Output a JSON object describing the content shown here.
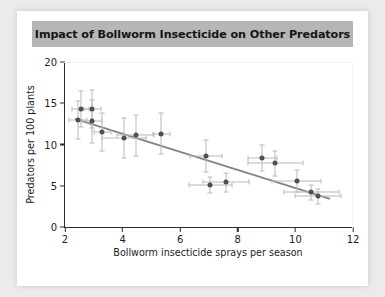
{
  "figure": {
    "title": "Impact of Bollworm Insecticide on Other Predators",
    "title_bar_color": "#b6b6b6",
    "background": "#ffffff",
    "page_background": "#eceaea"
  },
  "chart_data": {
    "type": "scatter",
    "title": "Impact of Bollworm Insecticide on Other Predators",
    "xlabel": "Bollworm insecticide sprays per season",
    "ylabel": "Predators per 100 plants",
    "xlim": [
      2,
      12
    ],
    "ylim": [
      0,
      20
    ],
    "xticks": [
      2,
      4,
      6,
      8,
      10,
      12
    ],
    "yticks": [
      0,
      5,
      10,
      15,
      20
    ],
    "grid": false,
    "legend": null,
    "marker_color": "#4b4f5c",
    "errorbar_color": "#b9b9b9",
    "trendline_color": "#8c7f8c",
    "points": [
      {
        "x": 2.45,
        "y": 13.0,
        "xerr": 0.3,
        "yerr": 2.3
      },
      {
        "x": 2.55,
        "y": 14.3,
        "xerr": 0.3,
        "yerr": 2.2
      },
      {
        "x": 2.95,
        "y": 14.3,
        "xerr": 0.3,
        "yerr": 2.3
      },
      {
        "x": 2.95,
        "y": 12.8,
        "xerr": 0.35,
        "yerr": 2.6
      },
      {
        "x": 3.3,
        "y": 11.5,
        "xerr": 0.3,
        "yerr": 2.3
      },
      {
        "x": 4.05,
        "y": 10.8,
        "xerr": 0.75,
        "yerr": 2.4
      },
      {
        "x": 4.45,
        "y": 11.1,
        "xerr": 0.65,
        "yerr": 2.5
      },
      {
        "x": 5.35,
        "y": 11.3,
        "xerr": 0.3,
        "yerr": 2.5
      },
      {
        "x": 6.9,
        "y": 8.6,
        "xerr": 0.55,
        "yerr": 1.9
      },
      {
        "x": 7.05,
        "y": 5.1,
        "xerr": 0.75,
        "yerr": 1.0
      },
      {
        "x": 7.6,
        "y": 5.4,
        "xerr": 0.8,
        "yerr": 1.1
      },
      {
        "x": 8.85,
        "y": 8.4,
        "xerr": 0.5,
        "yerr": 1.6
      },
      {
        "x": 9.3,
        "y": 7.7,
        "xerr": 0.95,
        "yerr": 1.5
      },
      {
        "x": 10.05,
        "y": 5.6,
        "xerr": 0.85,
        "yerr": 1.3
      },
      {
        "x": 10.55,
        "y": 4.2,
        "xerr": 0.95,
        "yerr": 0.9
      },
      {
        "x": 10.8,
        "y": 3.7,
        "xerr": 0.8,
        "yerr": 0.9
      }
    ],
    "trendline": {
      "x1": 2.35,
      "y1": 13.1,
      "x2": 11.2,
      "y2": 3.4
    }
  }
}
